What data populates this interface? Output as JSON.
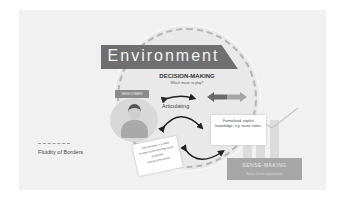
{
  "diagram": {
    "banner_title": "Environment",
    "decision_making": {
      "title": "DECISION-MAKING",
      "subtitle": "Which music to play?"
    },
    "articulating_label": "Articulating",
    "newcomer_label": "NEWCOMER",
    "tacit_card": {
      "lines": [
        "Tacit knowing, e.g. skills",
        "to make sense and play music",
        "social and",
        "cultural conventions"
      ]
    },
    "formal_card": {
      "text": "Formalised, explicit knowledge, e.g. music notes."
    },
    "sense_making": {
      "title": "SENSE-MAKING",
      "subtitle": "Sense of own improvement"
    },
    "legend": {
      "label": "Fluidity of Borders"
    },
    "colors": {
      "banner": "#6f6f6f",
      "background": "#f1f1f1",
      "circle": "#e9e9e9",
      "dash": "#b5b5b5",
      "arrow_dark": "#6a6a6a",
      "arrow_light": "#a5a5a5",
      "sense_box": "#a6a6a6"
    }
  }
}
